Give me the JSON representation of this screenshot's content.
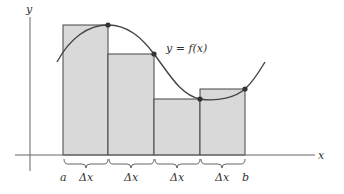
{
  "diagram": {
    "axes": {
      "x_label": "x",
      "y_label": "y"
    },
    "curve_label": "y = f(x)",
    "interval": {
      "start_label": "a",
      "end_label": "b"
    },
    "subintervals": [
      {
        "label": "Δx"
      },
      {
        "label": "Δx"
      },
      {
        "label": "Δx"
      },
      {
        "label": "Δx"
      }
    ],
    "colors": {
      "rect_fill": "#d9d9d9",
      "rect_stroke": "#444444",
      "curve": "#444444",
      "axis": "#666666",
      "point": "#333333"
    }
  }
}
